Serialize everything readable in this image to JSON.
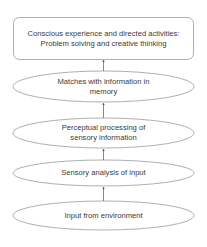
{
  "diagram": {
    "type": "flowchart",
    "direction": "bottom-to-top",
    "colors": {
      "stroke": "#9a9a9a",
      "text": "#3a3a3a",
      "arrow": "#555555",
      "background": "#ffffff"
    },
    "nodes": [
      {
        "id": "top",
        "shape": "rounded-rectangle",
        "lines": [
          "Conscious experience and directed activities:",
          "Problem solving and creative thinking"
        ]
      },
      {
        "id": "memory",
        "shape": "ellipse",
        "lines": [
          "Matches with information in",
          "memory"
        ]
      },
      {
        "id": "perceptual",
        "shape": "ellipse",
        "lines": [
          "Perceptual processing of",
          "sensory information"
        ]
      },
      {
        "id": "sensory",
        "shape": "ellipse",
        "lines": [
          "Sensory analysis of input"
        ]
      },
      {
        "id": "input",
        "shape": "ellipse",
        "lines": [
          "Input from environment"
        ]
      }
    ],
    "edges": [
      {
        "from": "input",
        "to": "sensory"
      },
      {
        "from": "sensory",
        "to": "perceptual"
      },
      {
        "from": "perceptual",
        "to": "memory"
      },
      {
        "from": "memory",
        "to": "top"
      }
    ]
  }
}
